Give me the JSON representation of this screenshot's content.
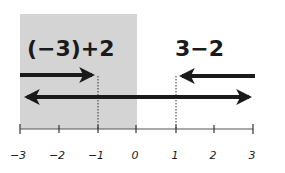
{
  "diagram": {
    "shaded_region": {
      "from": -3,
      "to": 0,
      "color": "#d4d4d4"
    },
    "expressions": {
      "left": "(−3)+2",
      "right": "3−2"
    },
    "number_line": {
      "min": -3,
      "max": 3,
      "ticks": [
        "−3",
        "−2",
        "−1",
        "0",
        "1",
        "2",
        "3"
      ]
    },
    "arrows": {
      "left_addition": {
        "from": -3,
        "to": -1,
        "direction": "right"
      },
      "right_subtraction": {
        "from": 3,
        "to": 1,
        "direction": "left"
      },
      "full_line": {
        "from": -3,
        "to": 3,
        "direction": "both"
      }
    },
    "markers": {
      "left_result": -1,
      "right_result": 1
    },
    "colors": {
      "ink": "#1a1a1a",
      "shade": "#d4d4d4",
      "axis": "#555555"
    }
  }
}
